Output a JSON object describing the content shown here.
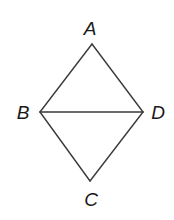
{
  "diagram": {
    "type": "geometry",
    "colors": {
      "line": "#3a3a3a",
      "text": "#1a1a1a",
      "background": "#ffffff"
    },
    "vertices": [
      {
        "id": "A",
        "label": "A",
        "x": 92,
        "y": 44,
        "label_x": 90,
        "label_y": 35
      },
      {
        "id": "B",
        "label": "B",
        "x": 40,
        "y": 112,
        "label_x": 23,
        "label_y": 119
      },
      {
        "id": "D",
        "label": "D",
        "x": 143,
        "y": 112,
        "label_x": 158,
        "label_y": 119
      },
      {
        "id": "C",
        "label": "C",
        "x": 90,
        "y": 181,
        "label_x": 91,
        "label_y": 206
      }
    ],
    "edges": [
      {
        "from": "A",
        "to": "B"
      },
      {
        "from": "A",
        "to": "D"
      },
      {
        "from": "B",
        "to": "D"
      },
      {
        "from": "B",
        "to": "C"
      },
      {
        "from": "D",
        "to": "C"
      }
    ]
  }
}
